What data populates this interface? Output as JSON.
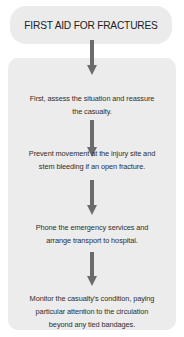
{
  "title": "FIRST AID FOR FRACTURES",
  "steps": [
    {
      "line1": "First, assess the situation and reassure",
      "line2": "the casualty."
    },
    {
      "line1": "Prevent movement at the injury site and",
      "line2": "stem bleeding if an open fracture."
    },
    {
      "line1": "Phone the emergency services and",
      "line2": "arrange transport to hospital."
    },
    {
      "line1": "Monitor the casualty's condition, paying",
      "line2": "particular attention to the circulation",
      "line3": "beyond any tied bandages."
    }
  ],
  "colors": {
    "box_background": "#ececec",
    "arrow": "#6b6b6b",
    "text": "#2e2e2e"
  }
}
